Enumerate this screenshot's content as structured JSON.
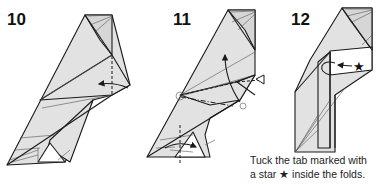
{
  "steps": [
    {
      "number": "10"
    },
    {
      "number": "11"
    },
    {
      "number": "12"
    }
  ],
  "caption": {
    "line1": "Tuck the tab marked with",
    "line2_prefix": "a star ",
    "star": "★",
    "line2_suffix": " inside the folds."
  },
  "colors": {
    "paper_fill": "#e2e2e2",
    "line": "#1a1a1a",
    "background": "#ffffff"
  }
}
